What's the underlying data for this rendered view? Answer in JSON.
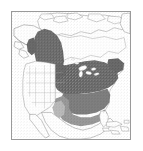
{
  "figure": {
    "title": "North America species distribution map",
    "kind": "range-map",
    "width_px": 143,
    "height_px": 151,
    "background_color": "#ffffff"
  },
  "frame": {
    "name": "map-border",
    "stroke_color": "#9a9a9a",
    "stroke_width_px": 1,
    "left_px": 11,
    "top_px": 11,
    "width_px": 120,
    "height_px": 129
  },
  "palette": {
    "core_range": "#2b2b2b",
    "secondary_range": "#4a4a4a",
    "peripheral_range": "#6f6f6f",
    "light_range": "#9d9d9d",
    "unshaded_land": "#ffffff",
    "coastline": "#4d4d4d",
    "political_boundary": "#8c8c8c",
    "ocean": "#ffffff",
    "speckle": "#777777"
  },
  "legend_regions": [
    {
      "name": "core-range",
      "label": "Core range",
      "color": "#2b2b2b"
    },
    {
      "name": "secondary-range",
      "label": "Secondary range",
      "color": "#4a4a4a"
    },
    {
      "name": "peripheral-range",
      "label": "Peripheral range",
      "color": "#6f6f6f"
    },
    {
      "name": "light-range",
      "label": "Marginal range",
      "color": "#9d9d9d"
    },
    {
      "name": "absent",
      "label": "Absent",
      "color": "#ffffff"
    }
  ],
  "landmasses": [
    {
      "name": "alaska",
      "label": "Alaska",
      "shaded": false
    },
    {
      "name": "western-canada",
      "label": "Western Canada",
      "shaded": true,
      "shade": "core_range"
    },
    {
      "name": "northern-canada",
      "label": "Northern Canada",
      "shaded": false
    },
    {
      "name": "arctic-islands",
      "label": "Arctic Archipelago",
      "shaded": false
    },
    {
      "name": "greenland-edge",
      "label": "Greenland",
      "shaded": false
    },
    {
      "name": "great-lakes-region",
      "label": "Great Lakes region",
      "shaded": true,
      "shade": "core_range"
    },
    {
      "name": "northeast-united-states",
      "label": "Northeastern United States",
      "shaded": true,
      "shade": "core_range"
    },
    {
      "name": "southeast-united-states",
      "label": "Southeastern United States",
      "shaded": true,
      "shade": "secondary_range"
    },
    {
      "name": "gulf-coast",
      "label": "Gulf Coast",
      "shaded": true,
      "shade": "peripheral_range"
    },
    {
      "name": "western-united-states",
      "label": "Western United States",
      "shaded": false
    },
    {
      "name": "great-plains",
      "label": "Great Plains",
      "shaded": false
    },
    {
      "name": "florida-peninsula",
      "label": "Florida",
      "shaded": false
    },
    {
      "name": "mexico",
      "label": "Mexico",
      "shaded": false
    },
    {
      "name": "caribbean-islands",
      "label": "Caribbean Islands",
      "shaded": false
    },
    {
      "name": "baja-california",
      "label": "Baja California",
      "shaded": false
    }
  ],
  "annotations": {
    "has_axis_labels": false,
    "has_legend_box": false,
    "has_scale_bar": false,
    "has_title_text": false,
    "has_graticule": false
  }
}
